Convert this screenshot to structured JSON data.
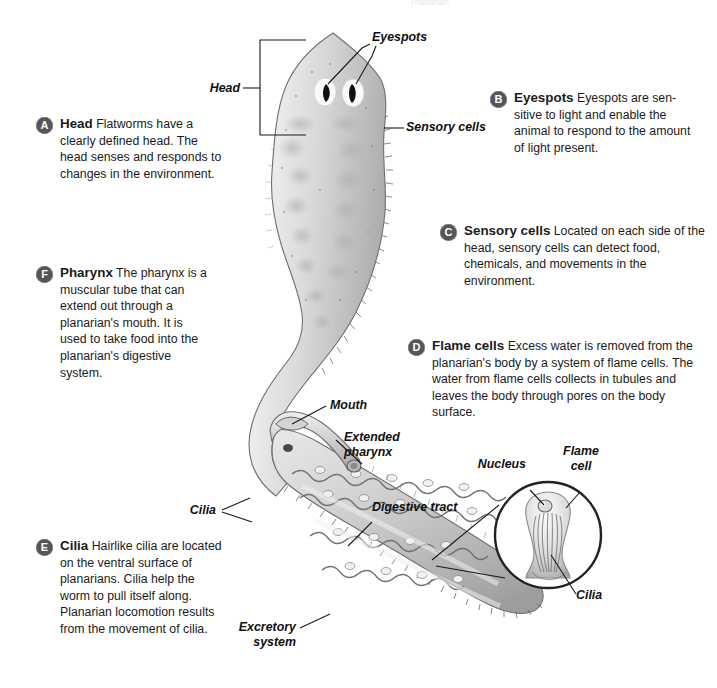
{
  "figure": {
    "partial_top_title": "Planarian",
    "organism": "planarian flatworm"
  },
  "callouts": [
    {
      "letter": "A",
      "term": "Head",
      "text": " Flatworms have a clearly defined head. The head senses and responds to changes in the environment."
    },
    {
      "letter": "B",
      "term": "Eyespots",
      "text": " Eyespots are sen-sitive to light and enable the animal to respond to the amount of light present."
    },
    {
      "letter": "C",
      "term": "Sensory cells",
      "text": " Located on each side of the head, sensory cells can detect food, chemicals, and movements in the environment."
    },
    {
      "letter": "D",
      "term": "Flame cells",
      "text": " Excess water is removed from the planarian's body by a system of flame cells. The water from flame cells collects in tubules and leaves the body through pores on the body surface."
    },
    {
      "letter": "E",
      "term": "Cilia",
      "text": " Hairlike cilia are located on the ventral surface of planarians. Cilia help the worm to pull itself along. Planarian locomotion results from the movement of cilia."
    },
    {
      "letter": "F",
      "term": "Pharynx",
      "text": " The pharynx is a muscular tube that can extend out through a planarian's mouth. It is used to take food into the planarian's digestive system."
    }
  ],
  "labels": {
    "head": "Head",
    "eyespots": "Eyespots",
    "sensory_cells": "Sensory cells",
    "mouth": "Mouth",
    "extended_pharynx": "Extended\npharynx",
    "cilia_body": "Cilia",
    "digestive_tract": "Digestive tract",
    "excretory_system": "Excretory\nsystem",
    "nucleus": "Nucleus",
    "flame_cell": "Flame\ncell",
    "cilia_inset": "Cilia"
  },
  "colors": {
    "badge": "#555557",
    "badge_text": "#ffffff",
    "text": "#1b1b1b",
    "leader_line": "#1a1a1a",
    "body_light": "#f2f2f2",
    "body_mid": "#c9c9c9",
    "body_dark": "#9a9a9a",
    "outline": "#6f6f6f",
    "eyespot": "#121212",
    "background": "#ffffff"
  }
}
